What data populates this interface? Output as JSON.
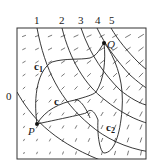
{
  "figure": {
    "frame": {
      "x": 17,
      "y": 28,
      "w": 129,
      "h": 131
    },
    "level_labels": [
      {
        "text": "0",
        "x": 6,
        "y": 100
      },
      {
        "text": "1",
        "x": 34,
        "y": 24
      },
      {
        "text": "2",
        "x": 59,
        "y": 24
      },
      {
        "text": "3",
        "x": 78,
        "y": 24
      },
      {
        "text": "4",
        "x": 95,
        "y": 24
      },
      {
        "text": "5",
        "x": 109,
        "y": 24
      }
    ],
    "points": {
      "P": {
        "label": "P",
        "x": 37,
        "y": 124,
        "lx": 28,
        "ly": 135
      },
      "Q": {
        "label": "Q",
        "x": 104,
        "y": 43,
        "lx": 107,
        "ly": 48
      }
    },
    "curve_labels": {
      "c1": {
        "text": "c",
        "sub": "1",
        "x": 34,
        "y": 70
      },
      "c": {
        "text": "c",
        "x": 54,
        "y": 105
      },
      "c2": {
        "text": "c",
        "sub": "2",
        "x": 106,
        "y": 131
      }
    },
    "colors": {
      "ink": "#1a1a1a",
      "field": "#555555",
      "frame": "#333333"
    }
  }
}
